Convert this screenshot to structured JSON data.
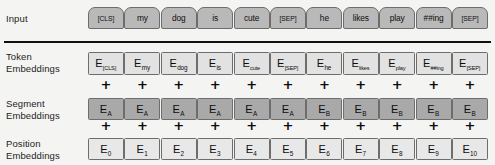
{
  "diagram": {
    "rows": [
      {
        "key": "input",
        "label_line1": "Input",
        "label_line2": ""
      },
      {
        "key": "token",
        "label_line1": "Token",
        "label_line2": "Embeddings"
      },
      {
        "key": "segment",
        "label_line1": "Segment",
        "label_line2": "Embeddings"
      },
      {
        "key": "position",
        "label_line1": "Position",
        "label_line2": "Embeddings"
      }
    ],
    "plus_symbol": "+",
    "columns": [
      {
        "input": "[CLS]",
        "token_sub": "[CLS]",
        "segment_sub": "A",
        "position_sub": "0"
      },
      {
        "input": "my",
        "token_sub": "my",
        "segment_sub": "A",
        "position_sub": "1"
      },
      {
        "input": "dog",
        "token_sub": "dog",
        "segment_sub": "A",
        "position_sub": "2"
      },
      {
        "input": "is",
        "token_sub": "is",
        "segment_sub": "A",
        "position_sub": "3"
      },
      {
        "input": "cute",
        "token_sub": "cute",
        "segment_sub": "A",
        "position_sub": "4"
      },
      {
        "input": "[SEP]",
        "token_sub": "[SEP]",
        "segment_sub": "A",
        "position_sub": "5"
      },
      {
        "input": "he",
        "token_sub": "he",
        "segment_sub": "B",
        "position_sub": "6"
      },
      {
        "input": "likes",
        "token_sub": "likes",
        "segment_sub": "B",
        "position_sub": "7"
      },
      {
        "input": "play",
        "token_sub": "play",
        "segment_sub": "B",
        "position_sub": "8"
      },
      {
        "input": "##ing",
        "token_sub": "##ing",
        "segment_sub": "B",
        "position_sub": "9"
      },
      {
        "input": "[SEP]",
        "token_sub": "[SEP]",
        "segment_sub": "B",
        "position_sub": "10"
      }
    ],
    "embedding_letter": "E",
    "colors": {
      "background": "#f4f4f2",
      "input_chip": "#b9b9b9",
      "token_box": "#e2e2e2",
      "segment_box": "#a9a9a9",
      "position_box": "#e8e8e8",
      "border": "#6d6d6d",
      "divider": "#101010",
      "text": "#0d0d0d"
    },
    "layout": {
      "first_column_left": 88,
      "column_pitch": 36.4,
      "column_width": 36
    }
  }
}
